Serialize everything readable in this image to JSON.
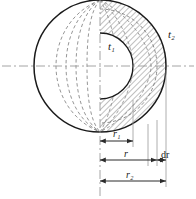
{
  "figure": {
    "labels": {
      "inner_surface_temp": "t₁",
      "outer_surface_temp": "t₂",
      "inner_radius": "r₁",
      "generic_radius": "r",
      "shell_thickness": "dr",
      "outer_radius": "r₂"
    },
    "colors": {
      "outline": "#1a1a1a",
      "hidden_line": "#8a8a8a",
      "centerline": "#9a9a9a",
      "hatch": "#4a4a4a",
      "dimension": "#2b2b2b",
      "background": "#ffffff"
    },
    "geometry": {
      "center_x": 100,
      "center_y": 66,
      "outer_radius_px": 66,
      "generic_radius_px": 57,
      "shell_outer_px": 66,
      "shell_inner_px": 57,
      "inner_radius_px": 33,
      "meridian_count": 4
    },
    "dimensions": [
      {
        "name": "r₁",
        "from_px": 100,
        "to_px": 133,
        "row_y": 141
      },
      {
        "name": "r",
        "from_px": 100,
        "to_px": 157,
        "row_y": 160
      },
      {
        "name": "dr",
        "from_px": 157,
        "to_px": 166,
        "row_y": 160
      },
      {
        "name": "r₂",
        "from_px": 100,
        "to_px": 166,
        "row_y": 181
      }
    ]
  }
}
